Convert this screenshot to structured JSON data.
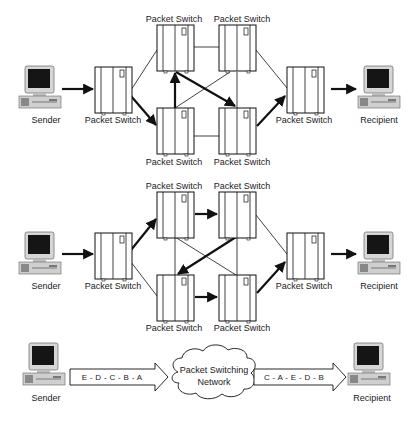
{
  "diagrams": [
    {
      "id": "route-a",
      "sender_label": "Sender",
      "recipient_label": "Recipient",
      "switch_label": "Packet Switch",
      "switches": {
        "entry": {
          "label": "Packet Switch"
        },
        "top_left": {
          "label": "Packet Switch"
        },
        "top_right": {
          "label": "Packet Switch"
        },
        "bottom_left": {
          "label": "Packet Switch"
        },
        "bottom_right": {
          "label": "Packet Switch"
        },
        "exit": {
          "label": "Packet Switch"
        }
      },
      "active_path": [
        "sender",
        "entry",
        "bottom_left",
        "top_left",
        "bottom_right",
        "exit",
        "recipient"
      ]
    },
    {
      "id": "route-b",
      "sender_label": "Sender",
      "recipient_label": "Recipient",
      "switches": {
        "entry": {
          "label": "Packet Switch"
        },
        "top_left": {
          "label": "Packet Switch"
        },
        "top_right": {
          "label": "Packet Switch"
        },
        "bottom_left": {
          "label": "Packet Switch"
        },
        "bottom_right": {
          "label": "Packet Switch"
        },
        "exit": {
          "label": "Packet Switch"
        }
      },
      "active_path": [
        "sender",
        "entry",
        "top_left",
        "top_right",
        "bottom_left",
        "bottom_right",
        "exit",
        "recipient"
      ]
    },
    {
      "id": "summary",
      "sender_label": "Sender",
      "recipient_label": "Recipient",
      "network_label_line1": "Packet Switching",
      "network_label_line2": "Network",
      "outgoing_packets": "E - D - C - B - A",
      "incoming_packets": "C - A - E - D - B"
    }
  ],
  "colors": {
    "line": "#111111",
    "computer_body": "#d8d8d8",
    "screen": "#111111",
    "background": "#ffffff"
  }
}
